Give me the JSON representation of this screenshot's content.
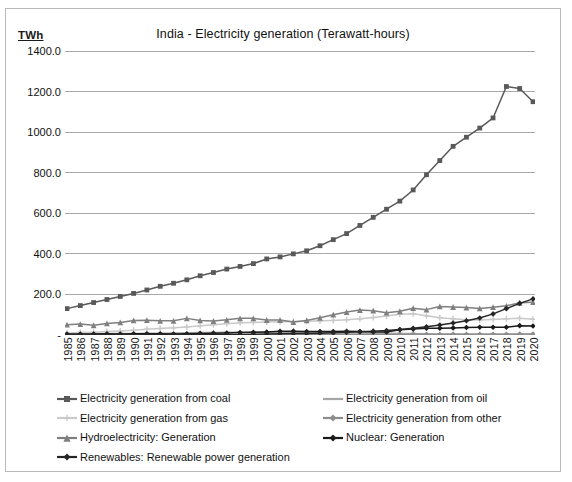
{
  "chart_data": {
    "type": "line",
    "title": "India - Electricity generation (Terawatt-hours)",
    "ylabel": "TWh",
    "xlabel": "",
    "ylim": [
      0,
      1400
    ],
    "ytick_labels": [
      "1400.0",
      "1200.0",
      "1000.0",
      "800.0",
      "600.0",
      "400.0",
      "200.0",
      "-"
    ],
    "ytick_values": [
      1400,
      1200,
      1000,
      800,
      600,
      400,
      200,
      0
    ],
    "grid": true,
    "legend_position": "bottom",
    "categories": [
      "1985",
      "1986",
      "1987",
      "1988",
      "1989",
      "1990",
      "1991",
      "1992",
      "1993",
      "1994",
      "1995",
      "1996",
      "1997",
      "1998",
      "1999",
      "2000",
      "2001",
      "2002",
      "2003",
      "2004",
      "2005",
      "2006",
      "2007",
      "2008",
      "2009",
      "2010",
      "2011",
      "2012",
      "2013",
      "2014",
      "2015",
      "2016",
      "2017",
      "2018",
      "2019",
      "2020"
    ],
    "series": [
      {
        "name": "Electricity generation from coal",
        "color": "#595959",
        "marker": "square",
        "values": [
          130,
          145,
          160,
          175,
          190,
          205,
          222,
          240,
          255,
          272,
          292,
          308,
          325,
          338,
          352,
          375,
          385,
          400,
          415,
          440,
          470,
          500,
          540,
          580,
          620,
          660,
          715,
          790,
          860,
          930,
          975,
          1020,
          1070,
          1225,
          1215,
          1150
        ]
      },
      {
        "name": "Electricity generation from oil",
        "color": "#a6a6a6",
        "marker": "dash",
        "values": [
          6,
          6,
          7,
          7,
          8,
          8,
          9,
          9,
          10,
          11,
          12,
          12,
          13,
          13,
          14,
          14,
          13,
          12,
          11,
          11,
          11,
          10,
          10,
          9,
          9,
          8,
          7,
          6,
          5,
          5,
          4,
          4,
          4,
          4,
          3,
          3
        ]
      },
      {
        "name": "Electricity generation from gas",
        "color": "#c9c9c9",
        "marker": "plus",
        "values": [
          10,
          12,
          14,
          17,
          20,
          24,
          28,
          32,
          36,
          40,
          45,
          50,
          56,
          60,
          62,
          64,
          65,
          66,
          68,
          70,
          72,
          75,
          80,
          86,
          94,
          102,
          105,
          95,
          85,
          80,
          75,
          74,
          77,
          80,
          82,
          78
        ]
      },
      {
        "name": "Electricity generation from other",
        "color": "#8c8c8c",
        "marker": "diamond",
        "values": [
          1,
          1,
          1,
          1,
          1,
          1,
          1,
          1,
          1,
          1,
          1,
          1,
          1,
          1,
          1,
          2,
          2,
          2,
          2,
          2,
          2,
          2,
          2,
          3,
          3,
          3,
          3,
          3,
          3,
          4,
          4,
          4,
          4,
          4,
          5,
          5
        ]
      },
      {
        "name": "Hydroelectricity: Generation",
        "color": "#7f7f7f",
        "marker": "triangle",
        "values": [
          51,
          54,
          48,
          57,
          62,
          72,
          73,
          70,
          70,
          82,
          72,
          69,
          75,
          82,
          82,
          74,
          74,
          64,
          72,
          85,
          100,
          113,
          123,
          120,
          110,
          117,
          132,
          125,
          141,
          138,
          135,
          131,
          137,
          144,
          159,
          162
        ]
      },
      {
        "name": "Nuclear: Generation",
        "color": "#1a1a1a",
        "marker": "diamond",
        "values": [
          5,
          5,
          5,
          6,
          5,
          6,
          6,
          6,
          5,
          6,
          8,
          9,
          10,
          12,
          13,
          15,
          18,
          19,
          17,
          17,
          17,
          18,
          17,
          15,
          15,
          26,
          29,
          33,
          33,
          35,
          37,
          38,
          38,
          38,
          46,
          44
        ]
      },
      {
        "name": "Renewables: Renewable power generation",
        "color": "#262626",
        "marker": "diamond",
        "values": [
          0,
          0,
          0,
          0,
          0,
          0,
          1,
          1,
          1,
          1,
          2,
          2,
          3,
          3,
          4,
          5,
          6,
          7,
          8,
          9,
          11,
          13,
          16,
          19,
          22,
          27,
          33,
          41,
          49,
          59,
          70,
          84,
          104,
          130,
          156,
          178
        ]
      }
    ]
  },
  "legend": {
    "left_column": [
      "Electricity generation from coal",
      "Electricity generation from gas",
      "Hydroelectricity: Generation",
      "Renewables: Renewable power generation"
    ],
    "right_column": [
      "Electricity generation from oil",
      "Electricity generation from other",
      "Nuclear: Generation"
    ]
  }
}
